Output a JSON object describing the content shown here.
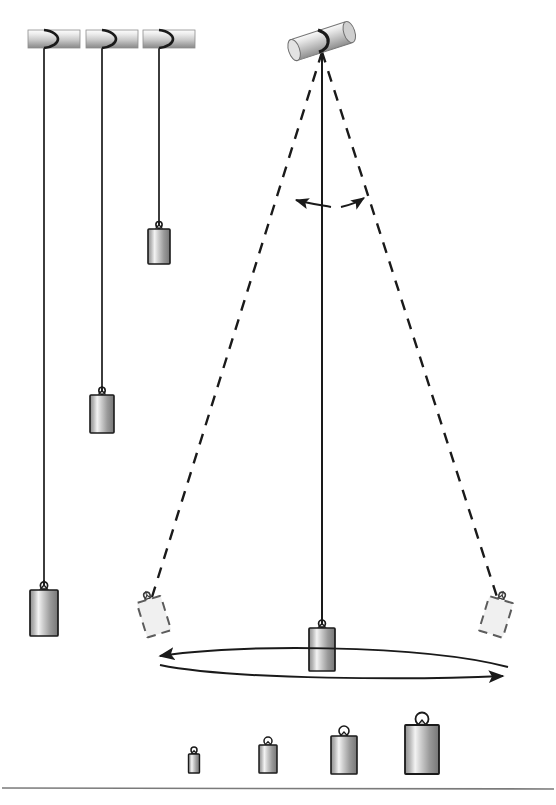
{
  "figure": {
    "background_color": "#ffffff",
    "width": 556,
    "height": 805,
    "stroke_color": "#1a1a1a",
    "ghost_fill": "#f0f0f0",
    "ghost_stroke": "#808080",
    "rod_light": "#f2f2f2",
    "rod_mid": "#c8c8c8",
    "rod_dark": "#8c8c8c",
    "bob_light": "#f4f4f4",
    "bob_mid": "#b0b0b0",
    "bob_dark": "#6e6e6e"
  },
  "hanging_pendulums": {
    "label": "Three pendulums of different string lengths",
    "items": [
      {
        "name": "long-pendulum",
        "rod": {
          "x": 28,
          "y": 30,
          "width": 52,
          "height": 18
        },
        "pivot_x": 44,
        "string_top": 33,
        "bob_top": 592,
        "bob": {
          "width": 28,
          "height": 45
        },
        "string_length_px": 559
      },
      {
        "name": "medium-pendulum",
        "rod": {
          "x": 86,
          "y": 30,
          "width": 52,
          "height": 18
        },
        "pivot_x": 102,
        "string_top": 33,
        "bob_top": 396,
        "bob": {
          "width": 24,
          "height": 38
        },
        "string_length_px": 363
      },
      {
        "name": "short-pendulum",
        "rod": {
          "x": 143,
          "y": 30,
          "width": 52,
          "height": 18
        },
        "pivot_x": 159,
        "string_top": 33,
        "bob_top": 230,
        "bob": {
          "width": 22,
          "height": 34
        },
        "string_length_px": 197
      }
    ]
  },
  "swinging_pendulum": {
    "label": "Pendulum swinging through an arc",
    "pivot": {
      "x": 322,
      "y": 46
    },
    "pivot_rod": {
      "cx": 322,
      "cy": 42,
      "length": 58,
      "thickness": 20,
      "angle_deg": -18
    },
    "rest_string": {
      "x1": 322,
      "y1": 48,
      "x2": 322,
      "y2": 628
    },
    "rest_bob": {
      "x": 309,
      "y": 632,
      "width": 26,
      "height": 42
    },
    "left_extreme": {
      "x": 150,
      "y": 592,
      "angle_deg": -17
    },
    "right_extreme": {
      "x": 495,
      "y": 592,
      "angle_deg": 17
    },
    "dashed_strings": [
      {
        "x1": 322,
        "y1": 50,
        "x2": 150,
        "y2": 598
      },
      {
        "x1": 322,
        "y1": 50,
        "x2": 497,
        "y2": 598
      }
    ],
    "angle_arrows": {
      "label": "Amplitude angle arrows",
      "left": {
        "from_x": 332,
        "from_y": 206,
        "to_x": 292,
        "to_y": 202
      },
      "right": {
        "from_x": 340,
        "from_y": 206,
        "to_x": 362,
        "to_y": 198
      }
    },
    "swing_arc": {
      "label": "Swing path double arrow",
      "left_tip_x": 152,
      "right_tip_x": 508,
      "y": 660,
      "sag": 24
    }
  },
  "mass_series": {
    "label": "Four bob masses of increasing size",
    "baseline_y": 775,
    "items": [
      {
        "name": "mass-1",
        "cx": 194,
        "width": 11,
        "height": 19,
        "ring_r": 3
      },
      {
        "name": "mass-2",
        "cx": 268,
        "width": 18,
        "height": 29,
        "ring_r": 4
      },
      {
        "name": "mass-3",
        "cx": 344,
        "width": 26,
        "height": 38,
        "ring_r": 5
      },
      {
        "name": "mass-4",
        "cx": 422,
        "width": 34,
        "height": 50,
        "ring_r": 6.5
      }
    ]
  },
  "footer_rule": {
    "label": "Horizontal divider rule",
    "y": 788,
    "x1": 2,
    "x2": 554
  }
}
